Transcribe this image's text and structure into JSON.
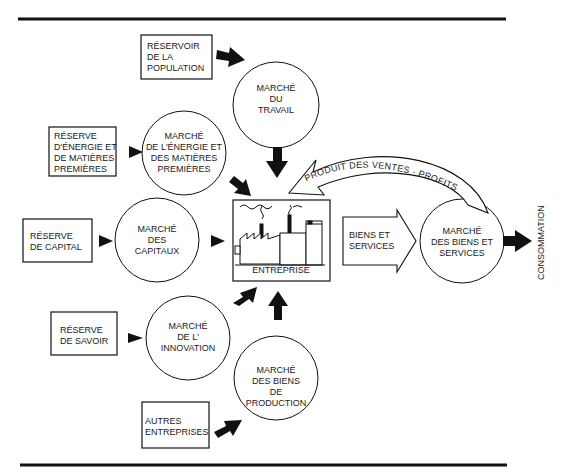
{
  "diagram": {
    "type": "flow",
    "colors": {
      "ink": "#111111",
      "background": "#ffffff"
    },
    "reserves": [
      {
        "id": "population",
        "lines": [
          "RÉSERVOIR",
          "DE LA",
          "POPULATION"
        ]
      },
      {
        "id": "energie",
        "lines": [
          "RÉSERVE",
          "D'ÉNERGIE ET",
          "DE MATIÈRES",
          "PREMIÈRES"
        ]
      },
      {
        "id": "capital",
        "lines": [
          "RÉSERVE",
          "DE CAPITAL"
        ]
      },
      {
        "id": "savoir",
        "lines": [
          "RÉSERVE",
          "DE SAVOIR"
        ]
      },
      {
        "id": "autres",
        "lines": [
          "AUTRES",
          "ENTREPRISES"
        ]
      }
    ],
    "markets": [
      {
        "id": "travail",
        "lines": [
          "MARCHÉ",
          "DU",
          "TRAVAIL"
        ]
      },
      {
        "id": "energie",
        "lines": [
          "MARCHÉ",
          "DE L'ÉNERGIE ET",
          "DES MATIÈRES",
          "PREMIÈRES"
        ]
      },
      {
        "id": "capitaux",
        "lines": [
          "MARCHÉ",
          "DES",
          "CAPITAUX"
        ]
      },
      {
        "id": "innovation",
        "lines": [
          "MARCHÉ",
          "DE L'",
          "INNOVATION"
        ]
      },
      {
        "id": "production",
        "lines": [
          "MARCHÉ",
          "DES BIENS",
          "DE",
          "PRODUCTION"
        ]
      },
      {
        "id": "biens_services",
        "lines": [
          "MARCHÉ",
          "DES BIENS ET",
          "SERVICES"
        ]
      }
    ],
    "enterprise": {
      "label": "ENTREPRISE",
      "icon": "factory-icon"
    },
    "flows": {
      "output": {
        "lines": [
          "BIENS ET",
          "SERVICES"
        ]
      },
      "feedback": "PRODUIT DES VENTES · PROFITS",
      "final": "CONSOMMATION"
    }
  }
}
